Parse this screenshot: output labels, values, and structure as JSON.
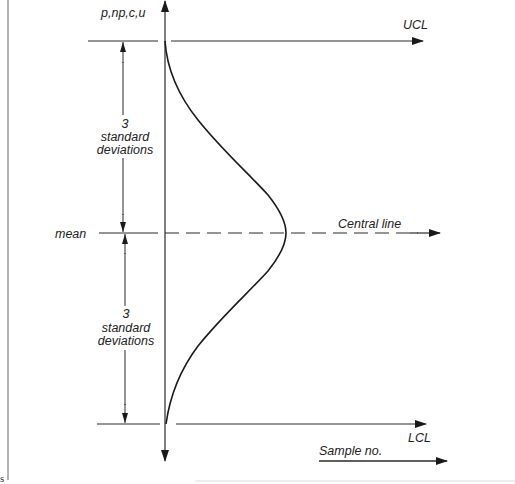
{
  "diagram": {
    "labels": {
      "y_axis": "p,np,c,u",
      "ucl": "UCL",
      "lcl": "LCL",
      "central_line": "Central line",
      "mean": "mean",
      "x_axis": "Sample no.",
      "upper_sd": {
        "line1": "3",
        "line2": "standard",
        "line3": "deviations"
      },
      "lower_sd": {
        "line1": "3",
        "line2": "standard",
        "line3": "deviations"
      },
      "margin_fragment": "s"
    },
    "colors": {
      "line": "#2a2a2a",
      "text": "#222222",
      "background": "#ffffff"
    }
  }
}
